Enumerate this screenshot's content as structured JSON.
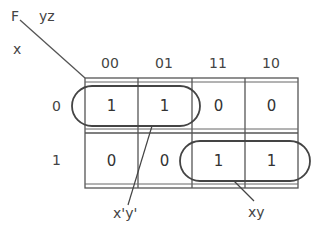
{
  "kmap": {
    "function_label": "F",
    "column_variables": "yz",
    "row_variable": "x",
    "column_headers": [
      "00",
      "01",
      "11",
      "10"
    ],
    "row_headers": [
      "0",
      "1"
    ],
    "cells": [
      [
        "1",
        "1",
        "0",
        "0"
      ],
      [
        "0",
        "0",
        "1",
        "1"
      ]
    ],
    "groups": [
      {
        "label": "x'y'",
        "cells": "row 0, columns 00-01"
      },
      {
        "label": "xy",
        "cells": "row 1, columns 11-10"
      }
    ]
  }
}
